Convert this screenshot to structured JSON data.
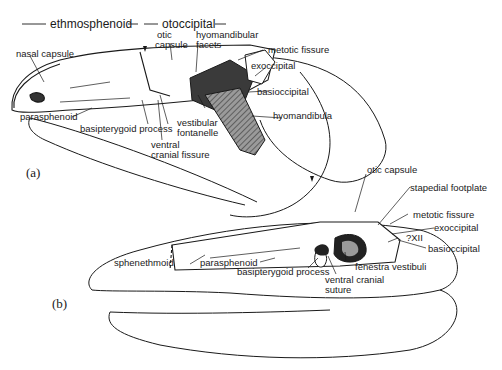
{
  "header": {
    "region_left": "ethmosphenoid",
    "region_right": "otoccipital"
  },
  "panel_a": {
    "label": "(a)",
    "labels": {
      "nasal_capsule": "nasal capsule",
      "otic_capsule_1": "otic",
      "otic_capsule_2": "capsule",
      "hyomandibular_facets_1": "hyomandibular",
      "hyomandibular_facets_2": "facets",
      "metotic_fissure": "metotic fissure",
      "exoccipital": "exoccipital",
      "basioccipital": "basioccipital",
      "hyomandibula": "hyomandibula",
      "parasphenoid": "parasphenoid",
      "basipterygoid_process": "basipterygoid process",
      "vestibular_fontanelle_1": "vestibular",
      "vestibular_fontanelle_2": "fontanelle",
      "ventral_cranial_fissure_1": "ventral",
      "ventral_cranial_fissure_2": "cranial fissure"
    }
  },
  "panel_b": {
    "label": "(b)",
    "labels": {
      "otic_capsule": "otic capsule",
      "stapedial_footplate": "stapedial footplate",
      "metotic_fissure": "metotic fissure",
      "exoccipital": "exoccipital",
      "xii": "?XII",
      "basioccipital": "basioccipital",
      "sphenethmoid": "sphenethmoid",
      "parasphenoid": "parasphenoid",
      "basipterygoid_process": "basipterygoid process",
      "fenestra_vestibuli": "fenestra vestibuli",
      "ventral_cranial_suture_1": "ventral cranial",
      "ventral_cranial_suture_2": "suture"
    }
  },
  "colors": {
    "ink": "#1a1a1a",
    "hatch": "#6b6b6b",
    "dark_fill": "#2a2a2a",
    "background": "#ffffff"
  }
}
